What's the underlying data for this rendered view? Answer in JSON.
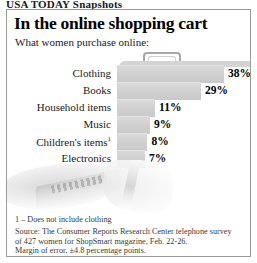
{
  "kicker": "USA TODAY Snapshots",
  "panel": {
    "title": "In the online shopping cart",
    "subtitle": "What women purchase online:"
  },
  "chart_data": {
    "type": "bar",
    "title": "In the online shopping cart",
    "subtitle": "What women purchase online:",
    "orientation": "horizontal",
    "xlabel": "",
    "ylabel": "",
    "xlim": [
      0,
      40
    ],
    "grid": false,
    "legend": "none",
    "categories": [
      "Clothing",
      "Books",
      "Household items",
      "Music",
      "Children's items",
      "Electronics"
    ],
    "values": [
      38,
      29,
      11,
      9,
      8,
      7
    ],
    "value_labels": [
      "38%",
      "29%",
      "11%",
      "9%",
      "8%",
      "7%"
    ],
    "category_labels": [
      "Clothing",
      "Books",
      "Household items",
      "Music",
      "Children's items¹",
      "Electronics"
    ],
    "footnote_markers": {
      "Children's items": "1"
    },
    "bar_color": "#d0d0d0",
    "text_color": "#000000"
  },
  "rows": [
    {
      "label": "Clothing",
      "sup": "",
      "value": "38%",
      "pct": 38
    },
    {
      "label": "Books",
      "sup": "",
      "value": "29%",
      "pct": 29
    },
    {
      "label": "Household items",
      "sup": "",
      "value": "11%",
      "pct": 11
    },
    {
      "label": "Music",
      "sup": "",
      "value": "9%",
      "pct": 9
    },
    {
      "label": "Children's items",
      "sup": "1",
      "value": "8%",
      "pct": 8
    },
    {
      "label": "Electronics",
      "sup": "",
      "value": "7%",
      "pct": 7
    }
  ],
  "footnote": "1 – Does not include clothing",
  "source": {
    "line1": "Source: The Consumer Reports Research Center telephone survey",
    "line2": "of 427 women for ShopSmart magazine, Feb. 22-26.",
    "line3": "Margin of error, ±4.8 percentage points."
  },
  "colors": {
    "bar": "#d0d0d0",
    "border": "#9a9a9a",
    "text": "#1a1a1a"
  }
}
